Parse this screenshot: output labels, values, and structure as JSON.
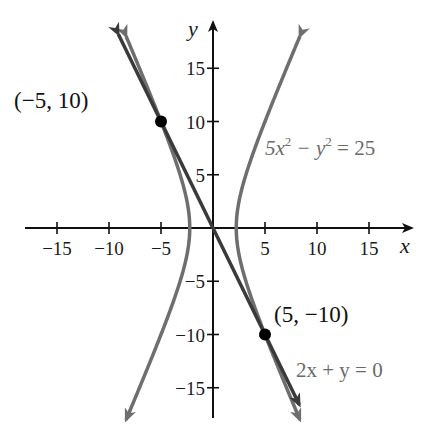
{
  "chart_data": {
    "type": "line",
    "title": "",
    "xlabel": "x",
    "ylabel": "y",
    "xlim": [
      -18,
      19
    ],
    "ylim": [
      -19,
      19
    ],
    "grid": false,
    "x_ticks": [
      -15,
      -10,
      -5,
      5,
      10,
      15
    ],
    "y_ticks": [
      15,
      10,
      5,
      -5,
      -10,
      -15
    ],
    "x_tick_labels": [
      "−15",
      "−10",
      "−5",
      "5",
      "10",
      "15"
    ],
    "y_tick_labels": [
      "15",
      "10",
      "5",
      "−5",
      "−10",
      "−15"
    ],
    "series": [
      {
        "name": "5x^2 - y^2 = 25",
        "kind": "hyperbola",
        "equation": "5x² − y² = 25",
        "color": "#6e6e6e",
        "y_range": [
          -18,
          18
        ]
      },
      {
        "name": "2x + y = 0",
        "kind": "line",
        "equation": "2x + y = 0",
        "color": "#3a3a3a",
        "x_range": [
          -9.1,
          8.3
        ]
      }
    ],
    "points": [
      {
        "x": -5,
        "y": 10,
        "label": "(−5, 10)"
      },
      {
        "x": 5,
        "y": -10,
        "label": "(5, −10)"
      }
    ],
    "annotations": [
      {
        "text": "5x² − y² = 25",
        "target": "hyperbola"
      },
      {
        "text": "2x + y = 0",
        "target": "line"
      }
    ]
  },
  "labels": {
    "x_axis": "x",
    "y_axis": "y",
    "point_a": "(−5, 10)",
    "point_b": "(5, −10)",
    "hyperbola_eq_main": "5x",
    "hyperbola_eq_sup1": "2",
    "hyperbola_eq_mid": " − y",
    "hyperbola_eq_sup2": "2",
    "hyperbola_eq_end": " = 25",
    "line_eq": "2x + y = 0"
  }
}
